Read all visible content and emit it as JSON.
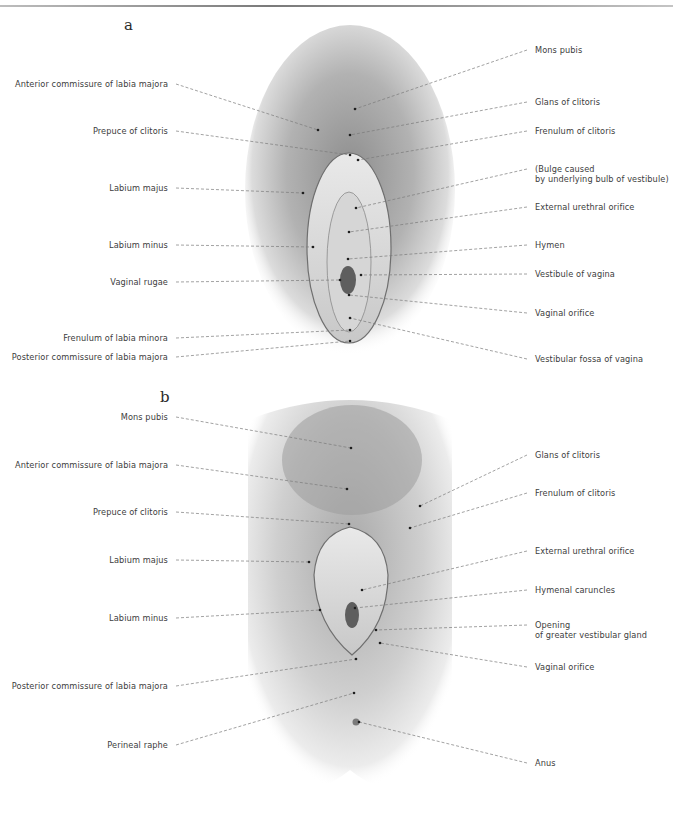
{
  "panels": [
    {
      "letter": "a",
      "left_labels": [
        {
          "text": "Anterior commissure of labia majora",
          "y": 84,
          "tx": 318,
          "ty": 130
        },
        {
          "text": "Prepuce of clitoris",
          "y": 131,
          "tx": 350,
          "ty": 155
        },
        {
          "text": "Labium majus",
          "y": 188,
          "tx": 303,
          "ty": 193
        },
        {
          "text": "Labium minus",
          "y": 245,
          "tx": 313,
          "ty": 247
        },
        {
          "text": "Vaginal rugae",
          "y": 282,
          "tx": 340,
          "ty": 280
        },
        {
          "text": "Frenulum of labia minora",
          "y": 338,
          "tx": 350,
          "ty": 330
        },
        {
          "text": "Posterior commissure of labia majora",
          "y": 357,
          "tx": 350,
          "ty": 341
        }
      ],
      "right_labels": [
        {
          "text": "Mons pubis",
          "y": 50,
          "tx": 355,
          "ty": 109
        },
        {
          "text": "Glans of clitoris",
          "y": 102,
          "tx": 350,
          "ty": 135
        },
        {
          "text": "Frenulum of clitoris",
          "y": 131,
          "tx": 358,
          "ty": 160
        },
        {
          "text": "(Bulge caused",
          "text2": "by underlying bulb of vestibule)",
          "y": 169,
          "tx": 356,
          "ty": 208
        },
        {
          "text": "External urethral orifice",
          "y": 207,
          "tx": 349,
          "ty": 232
        },
        {
          "text": "Hymen",
          "y": 245,
          "tx": 348,
          "ty": 259
        },
        {
          "text": "Vestibule of vagina",
          "y": 274,
          "tx": 361,
          "ty": 275
        },
        {
          "text": "Vaginal orifice",
          "y": 313,
          "tx": 349,
          "ty": 295
        },
        {
          "text": "Vestibular fossa of vagina",
          "y": 359,
          "tx": 350,
          "ty": 318
        }
      ]
    },
    {
      "letter": "b",
      "left_labels": [
        {
          "text": "Mons pubis",
          "y": 417,
          "tx": 351,
          "ty": 448
        },
        {
          "text": "Anterior commissure of labia majora",
          "y": 465,
          "tx": 347,
          "ty": 489
        },
        {
          "text": "Prepuce of clitoris",
          "y": 512,
          "tx": 349,
          "ty": 524
        },
        {
          "text": "Labium majus",
          "y": 560,
          "tx": 309,
          "ty": 562
        },
        {
          "text": "Labium minus",
          "y": 618,
          "tx": 320,
          "ty": 610
        },
        {
          "text": "Posterior commissure of labia majora",
          "y": 686,
          "tx": 356,
          "ty": 659
        },
        {
          "text": "Perineal raphe",
          "y": 745,
          "tx": 354,
          "ty": 693
        }
      ],
      "right_labels": [
        {
          "text": "Glans of clitoris",
          "y": 455,
          "tx": 420,
          "ty": 506
        },
        {
          "text": "Frenulum of clitoris",
          "y": 493,
          "tx": 410,
          "ty": 528
        },
        {
          "text": "External urethral orifice",
          "y": 551,
          "tx": 362,
          "ty": 590
        },
        {
          "text": "Hymenal caruncles",
          "y": 590,
          "tx": 355,
          "ty": 608
        },
        {
          "text": "Opening",
          "text2": "of greater vestibular gland",
          "y": 625,
          "tx": 376,
          "ty": 630
        },
        {
          "text": "Vaginal orifice",
          "y": 667,
          "tx": 380,
          "ty": 643
        },
        {
          "text": "Anus",
          "y": 763,
          "tx": 359,
          "ty": 722
        }
      ]
    }
  ],
  "colors": {
    "text": "#3d3d3d",
    "leader_line": "#7a7a7a",
    "figure_tone": "#9a9a9a"
  }
}
